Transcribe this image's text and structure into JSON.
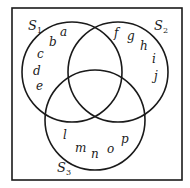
{
  "diagram": {
    "type": "venn",
    "universe": {
      "x": 12,
      "y": 8,
      "width": 170,
      "height": 172,
      "stroke": "#1a1a1a"
    },
    "sets": [
      {
        "name": "S",
        "sub": "1",
        "cx": 72,
        "cy": 72,
        "r": 50,
        "label_x": 28,
        "label_y": 30
      },
      {
        "name": "S",
        "sub": "2",
        "cx": 118,
        "cy": 72,
        "r": 50,
        "label_x": 154,
        "label_y": 30
      },
      {
        "name": "S",
        "sub": "3",
        "cx": 95,
        "cy": 120,
        "r": 50,
        "label_x": 57,
        "label_y": 172
      }
    ],
    "elements": [
      {
        "t": "a",
        "x": 60,
        "y": 36
      },
      {
        "t": "b",
        "x": 49,
        "y": 46
      },
      {
        "t": "c",
        "x": 37,
        "y": 58
      },
      {
        "t": "d",
        "x": 33,
        "y": 75
      },
      {
        "t": "e",
        "x": 36,
        "y": 90
      },
      {
        "t": "f",
        "x": 114,
        "y": 37
      },
      {
        "t": "g",
        "x": 127,
        "y": 40
      },
      {
        "t": "h",
        "x": 140,
        "y": 50
      },
      {
        "t": "i",
        "x": 152,
        "y": 63
      },
      {
        "t": "j",
        "x": 154,
        "y": 80
      },
      {
        "t": "l",
        "x": 63,
        "y": 139
      },
      {
        "t": "m",
        "x": 75,
        "y": 152
      },
      {
        "t": "n",
        "x": 91,
        "y": 158
      },
      {
        "t": "o",
        "x": 107,
        "y": 153
      },
      {
        "t": "p",
        "x": 121,
        "y": 143
      }
    ]
  }
}
